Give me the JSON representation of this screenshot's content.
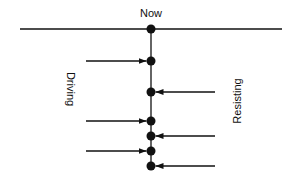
{
  "labels": {
    "now": "Now",
    "driving": "Driving",
    "resisting": "Resisting"
  },
  "colors": {
    "stroke": "#111111",
    "background": "#ffffff"
  },
  "timeline": {
    "horizontal_line": {
      "x1": 20,
      "x2": 282,
      "y": 29
    },
    "axis_x": 151,
    "axis_end_y": 167,
    "nodes_y": [
      29,
      61,
      92,
      121,
      136,
      151,
      166
    ]
  },
  "forces": {
    "driving": [
      {
        "y": 61,
        "from_x": 86
      },
      {
        "y": 121,
        "from_x": 86
      },
      {
        "y": 151,
        "from_x": 86
      }
    ],
    "resisting": [
      {
        "y": 92,
        "from_x": 215
      },
      {
        "y": 136,
        "from_x": 215
      },
      {
        "y": 166,
        "from_x": 215
      }
    ]
  }
}
